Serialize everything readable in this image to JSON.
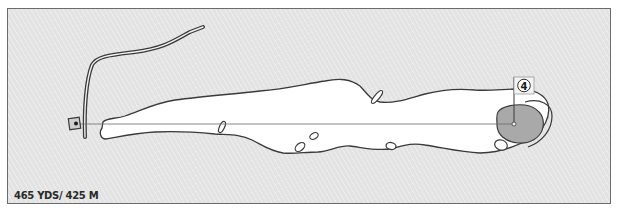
{
  "hole": {
    "number": "4",
    "distance_label": "465 YDS/ 425 M",
    "yards": 465,
    "metres": 425
  },
  "colors": {
    "rough": "#e3e3e3",
    "fairway": "#ffffff",
    "green": "#a9a9a9",
    "outline": "#3a3a3a",
    "frame_border": "#6b6b6b"
  },
  "features": {
    "tee": "tee-box",
    "fairway": "fairway",
    "green": "green",
    "flag": "flag-pin",
    "bunkers_count": 8,
    "path": "cart-path",
    "aim_line": "centre-line"
  }
}
